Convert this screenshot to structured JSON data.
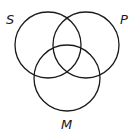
{
  "diagram": {
    "type": "venn",
    "sets": [
      {
        "label": "S",
        "cx": 48,
        "cy": 45,
        "r": 33,
        "label_x": 6,
        "label_y": 24
      },
      {
        "label": "P",
        "cx": 86,
        "cy": 45,
        "r": 33,
        "label_x": 120,
        "label_y": 24
      },
      {
        "label": "M",
        "cx": 67,
        "cy": 78,
        "r": 33,
        "label_x": 61,
        "label_y": 129
      }
    ],
    "stroke": "#1a1a1a"
  }
}
